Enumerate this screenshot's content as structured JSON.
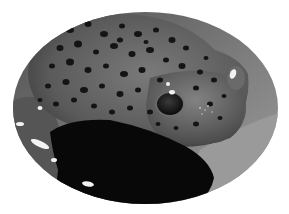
{
  "image": {
    "subject": "spotted amphibian (salamander/frog) resting on a surface",
    "style": "grayscale photograph in oval vignette",
    "frame": {
      "shape": "ellipse",
      "cx": 145.5,
      "cy": 108,
      "rx": 132.5,
      "ry": 96
    },
    "colors": {
      "page_background": "#ffffff",
      "backdrop": "#8a8a8a",
      "backdrop_light": "#a8a8a8",
      "body": "#5e5e5e",
      "body_light": "#7a7a7a",
      "spots": "#141414",
      "shadow": "#0a0a0a",
      "highlight": "#f2f2f2"
    },
    "spots": [
      [
        70,
        30,
        4,
        3
      ],
      [
        88,
        24,
        3.5,
        3
      ],
      [
        104,
        34,
        4,
        3
      ],
      [
        122,
        26,
        3,
        2.5
      ],
      [
        138,
        34,
        4,
        3
      ],
      [
        156,
        30,
        3,
        2.5
      ],
      [
        172,
        40,
        3.5,
        3
      ],
      [
        186,
        48,
        3,
        2.5
      ],
      [
        60,
        48,
        3.5,
        3
      ],
      [
        78,
        44,
        4,
        3.5
      ],
      [
        96,
        52,
        3,
        2.5
      ],
      [
        114,
        46,
        4,
        3
      ],
      [
        132,
        54,
        3.5,
        3
      ],
      [
        150,
        50,
        4,
        3
      ],
      [
        166,
        60,
        3,
        2.5
      ],
      [
        182,
        66,
        3.5,
        3
      ],
      [
        200,
        72,
        3,
        2.5
      ],
      [
        52,
        66,
        3,
        2.5
      ],
      [
        70,
        62,
        4,
        3.5
      ],
      [
        88,
        70,
        3.5,
        3
      ],
      [
        106,
        66,
        3,
        2.5
      ],
      [
        124,
        74,
        4,
        3
      ],
      [
        142,
        70,
        3.5,
        3
      ],
      [
        160,
        80,
        3,
        2.5
      ],
      [
        196,
        88,
        3,
        2.5
      ],
      [
        214,
        80,
        3,
        2.5
      ],
      [
        48,
        86,
        3,
        2.5
      ],
      [
        66,
        82,
        3.5,
        3
      ],
      [
        84,
        90,
        4,
        3
      ],
      [
        102,
        86,
        3,
        2.5
      ],
      [
        120,
        94,
        3.5,
        3
      ],
      [
        138,
        90,
        3,
        2.5
      ],
      [
        130,
        108,
        3,
        2.5
      ],
      [
        150,
        112,
        3,
        2.5
      ],
      [
        210,
        104,
        3,
        2.5
      ],
      [
        224,
        96,
        2.5,
        2
      ],
      [
        220,
        118,
        2.5,
        2
      ],
      [
        196,
        124,
        3,
        2.5
      ],
      [
        176,
        128,
        2.5,
        2
      ],
      [
        158,
        124,
        2.5,
        2
      ],
      [
        230,
        74,
        2.5,
        2
      ],
      [
        94,
        106,
        3,
        2.5
      ],
      [
        112,
        112,
        3,
        2.5
      ],
      [
        40,
        100,
        2.5,
        2
      ],
      [
        56,
        104,
        3,
        2.5
      ],
      [
        74,
        100,
        3,
        2.5
      ],
      [
        206,
        58,
        2.5,
        2
      ],
      [
        120,
        40,
        3,
        2.5
      ],
      [
        146,
        42,
        2.5,
        2
      ]
    ],
    "highlights": [
      [
        40,
        144,
        10,
        3,
        25
      ],
      [
        20,
        124,
        4,
        2,
        0
      ],
      [
        88,
        184,
        6,
        2.5,
        10
      ],
      [
        40,
        108,
        2.5,
        2,
        0
      ],
      [
        54,
        160,
        3,
        2,
        0
      ],
      [
        233,
        74,
        3,
        5,
        20
      ],
      [
        172,
        92,
        3,
        2,
        0
      ],
      [
        168,
        84,
        2,
        2,
        0
      ]
    ]
  }
}
